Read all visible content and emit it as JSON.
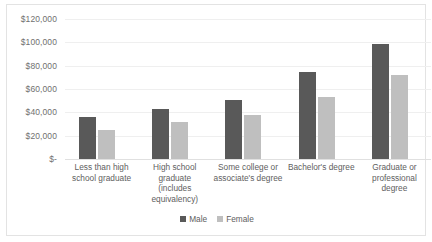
{
  "chart_data": {
    "type": "bar",
    "title": "",
    "xlabel": "",
    "ylabel": "",
    "ylim": [
      0,
      120000
    ],
    "grid": true,
    "legend_position": "bottom",
    "categories": [
      "Less than high school graduate",
      "High school graduate (includes equivalency)",
      "Some college or associate's degree",
      "Bachelor's degree",
      "Graduate or professional degree"
    ],
    "series": [
      {
        "name": "Male",
        "color": "#595959",
        "values": [
          36000,
          43000,
          51000,
          75000,
          99000
        ]
      },
      {
        "name": "Female",
        "color": "#bfbfbf",
        "values": [
          25000,
          32000,
          38000,
          53000,
          72000
        ]
      }
    ],
    "y_ticks": [
      {
        "value": 120000,
        "label": "$120,000"
      },
      {
        "value": 100000,
        "label": "$100,000"
      },
      {
        "value": 80000,
        "label": "$80,000"
      },
      {
        "value": 60000,
        "label": "$60,000"
      },
      {
        "value": 40000,
        "label": "$40,000"
      },
      {
        "value": 20000,
        "label": "$20,000"
      },
      {
        "value": 0,
        "label": "$-"
      }
    ],
    "x_tick_lines": [
      [
        "Less than high",
        "school graduate"
      ],
      [
        "High school",
        "graduate",
        "(includes",
        "equivalency)"
      ],
      [
        "Some college or",
        "associate's degree"
      ],
      [
        "Bachelor's degree"
      ],
      [
        "Graduate or",
        "professional",
        "degree"
      ]
    ]
  }
}
